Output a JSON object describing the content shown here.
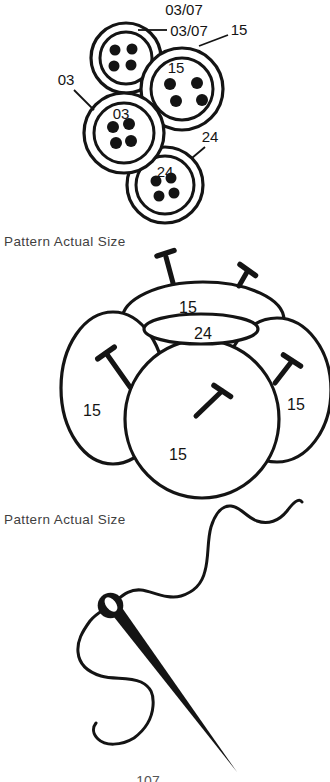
{
  "captions": {
    "buttons": "Pattern Actual Size",
    "flower": "Pattern Actual Size"
  },
  "page_number": "107",
  "buttons_diagram": {
    "callout_0307_a": "03/07",
    "callout_0307_b": "03/07",
    "callout_15": "15",
    "callout_03": "03",
    "callout_24": "24",
    "label_15": "15",
    "label_03": "03",
    "label_24": "24"
  },
  "flower_diagram": {
    "label_top": "15",
    "label_ellipse": "24",
    "label_left": "15",
    "label_right": "15",
    "label_center": "15"
  },
  "colors": {
    "ink": "#141414",
    "caption_text": "#3f3f3f",
    "paper": "#ffffff"
  }
}
